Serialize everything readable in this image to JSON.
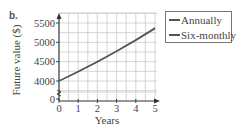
{
  "part_label": "b.",
  "chart_data": {
    "type": "line",
    "title": "",
    "xlabel": "Years",
    "ylabel": "Future value ($)",
    "x_ticks": [
      "0",
      "1",
      "2",
      "3",
      "4",
      "5"
    ],
    "y_ticks": [
      "0",
      "4000",
      "4500",
      "5000",
      "5500"
    ],
    "y_axis_break": true,
    "xlim": [
      0,
      5
    ],
    "ylim": [
      3750,
      5750
    ],
    "grid": true,
    "legend_position": "right-outside-top",
    "x": [
      0,
      0.5,
      1,
      1.5,
      2,
      2.5,
      3,
      3.5,
      4,
      4.5,
      5
    ],
    "series": [
      {
        "name": "Annually",
        "x": [
          0,
          1,
          2,
          3,
          4,
          5
        ],
        "values": [
          4000,
          4240,
          4494.4,
          4764.06,
          5049.91,
          5352.9
        ]
      },
      {
        "name": "Six-monthly",
        "x": [
          0,
          0.5,
          1,
          1.5,
          2,
          2.5,
          3,
          3.5,
          4,
          4.5,
          5
        ],
        "values": [
          4000,
          4120,
          4243.6,
          4370.91,
          4502.04,
          4637.1,
          4776.21,
          4919.5,
          5067.08,
          5219.09,
          5375.66
        ]
      }
    ],
    "colors": {
      "line": "#555555",
      "grid": "#cccccc",
      "axis": "#333333"
    }
  }
}
